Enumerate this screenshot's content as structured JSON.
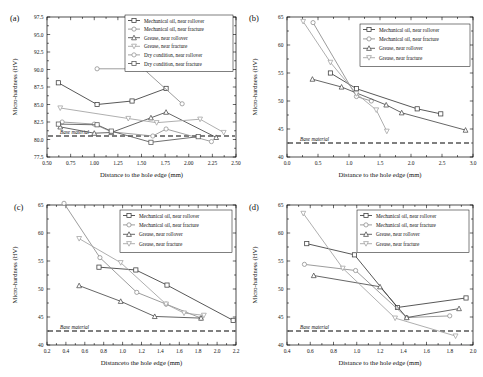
{
  "figure": {
    "panels": [
      "(a)",
      "(b)",
      "(c)",
      "(d)"
    ],
    "base_material_label": "Base material",
    "ylabel": "Micro-hardness (HV)"
  },
  "series_colors": {
    "mechanical_oil_rollover": "#3a3a3a",
    "mechanical_oil_fracture": "#8a8a8a",
    "grease_rollover": "#4a4a4a",
    "grease_fracture": "#a0a0a0",
    "dry_rollover": "#909090",
    "dry_fracture": "#555555",
    "base_line": "#000000"
  },
  "chart_data": [
    {
      "type": "line",
      "panel": "(a)",
      "title": "",
      "xlabel": "Distance to the hole edge (mm)",
      "ylabel": "Micro-hardness (HV)",
      "xlim": [
        0.5,
        2.5
      ],
      "ylim": [
        77.5,
        97.5
      ],
      "xticks": [
        "0.50",
        "0.75",
        "1.00",
        "1.25",
        "1.50",
        "1.75",
        "2.00",
        "2.25",
        "2.50"
      ],
      "yticks": [
        "77.5",
        "80.0",
        "82.5",
        "85.0",
        "87.5",
        "90.0",
        "92.5",
        "95.0",
        "97.5"
      ],
      "grid": false,
      "legend_position": "top-right",
      "annotations": [
        {
          "text": "Base material",
          "y": 80.5
        }
      ],
      "base_material_y": 80.5,
      "series": [
        {
          "name": "Mechanical oil, near rollover",
          "marker": "square",
          "x": [
            0.62,
            1.03,
            1.4,
            1.76
          ],
          "y": [
            88.1,
            85.0,
            85.5,
            87.3
          ]
        },
        {
          "name": "Mechanical oil, near fracture",
          "marker": "circle",
          "x": [
            1.03,
            1.52,
            1.93
          ],
          "y": [
            90.1,
            90.1,
            85.1
          ]
        },
        {
          "name": "Grease, near rollover",
          "marker": "triangle-up",
          "x": [
            0.64,
            1.0,
            1.18,
            1.6,
            1.76,
            2.29
          ],
          "y": [
            81.8,
            80.9,
            81.0,
            83.1,
            83.9,
            80.3
          ]
        },
        {
          "name": "Grease, near fracture",
          "marker": "triangle-down",
          "x": [
            0.64,
            1.36,
            1.66,
            2.12,
            2.37
          ],
          "y": [
            84.5,
            83.0,
            82.4,
            82.9,
            81.0
          ]
        },
        {
          "name": "Dry condition, near rollover",
          "marker": "circle",
          "x": [
            0.66,
            1.0,
            1.18,
            1.62,
            1.76,
            2.24
          ],
          "y": [
            82.5,
            82.2,
            81.1,
            80.5,
            81.5,
            79.7
          ]
        },
        {
          "name": "Dry condition, near fracture",
          "marker": "square",
          "x": [
            0.62,
            1.03,
            1.18,
            1.6,
            2.1
          ],
          "y": [
            82.2,
            82.1,
            81.2,
            79.6,
            80.4
          ]
        }
      ]
    },
    {
      "type": "line",
      "panel": "(b)",
      "title": "",
      "xlabel": "Distance to the hole edge (mm)",
      "ylabel": "Micro-hardness (HV)",
      "xlim": [
        0.0,
        3.0
      ],
      "ylim": [
        40,
        65
      ],
      "xticks": [
        "0.0",
        "0.5",
        "1.0",
        "1.5",
        "2.0",
        "2.5",
        "3.0"
      ],
      "yticks": [
        "40",
        "45",
        "50",
        "55",
        "60",
        "65"
      ],
      "grid": false,
      "legend_position": "top-right",
      "annotations": [
        {
          "text": "Base material",
          "y": 42.5
        }
      ],
      "base_material_y": 42.5,
      "series": [
        {
          "name": "Mechanical oil, near rollover",
          "marker": "square",
          "x": [
            0.7,
            1.12,
            2.1,
            2.48
          ],
          "y": [
            55.0,
            52.2,
            48.6,
            47.7
          ]
        },
        {
          "name": "Mechanical oil, near fracture",
          "marker": "circle",
          "x": [
            0.42,
            1.12,
            1.36
          ],
          "y": [
            64.0,
            50.8,
            50.0
          ]
        },
        {
          "name": "Grease, near rollover",
          "marker": "triangle-up",
          "x": [
            0.41,
            0.88,
            1.6,
            1.85,
            2.88
          ],
          "y": [
            53.9,
            52.5,
            49.3,
            47.9,
            44.8
          ]
        },
        {
          "name": "Grease, near fracture",
          "marker": "triangle-down",
          "x": [
            0.26,
            0.7,
            1.12,
            1.44,
            1.61
          ],
          "y": [
            64.2,
            56.9,
            51.3,
            48.4,
            44.6
          ]
        }
      ]
    },
    {
      "type": "line",
      "panel": "(c)",
      "title": "",
      "xlabel": "Distanceto the hole edge (mm)",
      "ylabel": "Micro-hardness (HV)",
      "xlim": [
        0.2,
        2.2
      ],
      "ylim": [
        40,
        65
      ],
      "xticks": [
        "0.2",
        "0.4",
        "0.6",
        "0.8",
        "1.0",
        "1.2",
        "1.4",
        "1.6",
        "1.8",
        "2.0",
        "2.2"
      ],
      "yticks": [
        "40",
        "45",
        "50",
        "55",
        "60",
        "65"
      ],
      "grid": false,
      "legend_position": "top-right",
      "annotations": [
        {
          "text": "Base material",
          "y": 42.5
        }
      ],
      "base_material_y": 42.5,
      "series": [
        {
          "name": "Mechanical oil, near rollover",
          "marker": "square",
          "x": [
            0.75,
            1.14,
            1.47,
            2.17
          ],
          "y": [
            53.9,
            53.4,
            50.7,
            44.4
          ]
        },
        {
          "name": "Mechanical oil, near fracture",
          "marker": "circle",
          "x": [
            0.38,
            0.76,
            1.15,
            1.46,
            1.83
          ],
          "y": [
            65.3,
            55.6,
            49.4,
            47.3,
            44.8
          ]
        },
        {
          "name": "Grease, near rollover",
          "marker": "triangle-up",
          "x": [
            0.54,
            0.98,
            1.34,
            1.83
          ],
          "y": [
            50.6,
            47.8,
            45.1,
            44.8
          ]
        },
        {
          "name": "Grease, near fracture",
          "marker": "triangle-down",
          "x": [
            0.54,
            0.98,
            1.46,
            1.65,
            1.86
          ],
          "y": [
            59.0,
            54.7,
            47.3,
            45.7,
            45.3
          ]
        }
      ]
    },
    {
      "type": "line",
      "panel": "(d)",
      "title": "",
      "xlabel": "Distance to the hole edge (mm)",
      "ylabel": "Micro-hardness (HV)",
      "xlim": [
        0.4,
        2.0
      ],
      "ylim": [
        40,
        65
      ],
      "xticks": [
        "0.4",
        "0.6",
        "0.8",
        "1.0",
        "1.2",
        "1.4",
        "1.6",
        "1.8",
        "2.0"
      ],
      "yticks": [
        "40",
        "45",
        "50",
        "55",
        "60",
        "65"
      ],
      "grid": false,
      "legend_position": "top-right",
      "annotations": [
        {
          "text": "Base material",
          "y": 42.5
        }
      ],
      "base_material_y": 42.5,
      "series": [
        {
          "name": "Mechanical oil, near rollover",
          "marker": "square",
          "x": [
            0.57,
            0.98,
            1.35,
            1.94
          ],
          "y": [
            58.1,
            56.1,
            46.7,
            48.4
          ]
        },
        {
          "name": "Mechanical oil, near fracture",
          "marker": "circle",
          "x": [
            0.55,
            0.99,
            1.43,
            1.8
          ],
          "y": [
            54.4,
            53.3,
            44.9,
            45.2
          ]
        },
        {
          "name": "Grease, near rollover",
          "marker": "triangle-up",
          "x": [
            0.63,
            1.2,
            1.43,
            1.88
          ],
          "y": [
            52.4,
            50.4,
            44.9,
            46.5
          ]
        },
        {
          "name": "Grease, near fracture",
          "marker": "triangle-down",
          "x": [
            0.54,
            0.88,
            1.33,
            1.85
          ],
          "y": [
            63.5,
            53.7,
            44.8,
            41.6
          ]
        }
      ]
    }
  ],
  "legends": {
    "panel_a": [
      "Mechanical oil, near rollover",
      "Mechanical oil, near fracture",
      "Grease, near rollover",
      "Grease, near fracture",
      "Dry condition, near rollover",
      "Dry condition, near fracture"
    ],
    "panel_bcd": [
      "Mechanical oil, near rollover",
      "Mechanical oil, near fracture",
      "Grease, near rollover",
      "Grease, near fracture"
    ]
  }
}
